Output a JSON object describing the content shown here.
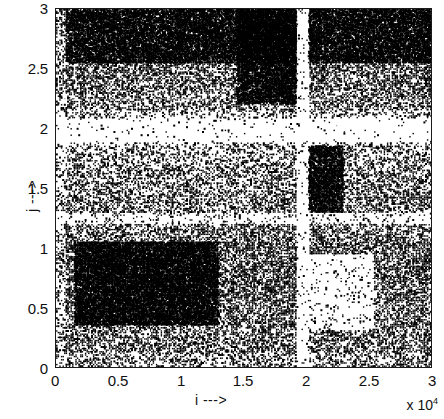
{
  "chart_data": {
    "type": "scatter",
    "title": "",
    "subtitle": "",
    "xlabel": "i --->",
    "ylabel": "j --->",
    "x_exponent_label": "x 10",
    "x_exponent_power": "4",
    "xlim": [
      0,
      3
    ],
    "ylim": [
      0,
      3
    ],
    "x_unit_scale": 10000,
    "y_unit_scale": 10000,
    "xticks": [
      "0",
      "0.5",
      "1",
      "1.5",
      "2",
      "2.5",
      "3"
    ],
    "yticks": [
      "0",
      "0.5",
      "1",
      "1.5",
      "2",
      "2.5",
      "3"
    ],
    "xtick_values": [
      0,
      0.5,
      1,
      1.5,
      2,
      2.5,
      3
    ],
    "ytick_values": [
      0,
      0.5,
      1,
      1.5,
      2,
      2.5,
      3
    ],
    "grid": false,
    "legend": null,
    "marker_color": "#000000",
    "background_color": "#ffffff",
    "axis_color": "#1a1a1a",
    "density_bands": {
      "note": "Approximate point-density as fraction of area covered, read from the image. Rows are horizontal bands in j, columns are vertical bands in i.",
      "j_bands": [
        {
          "from": 2.88,
          "to": 3.0,
          "density": 0.72
        },
        {
          "from": 2.6,
          "to": 2.88,
          "density": 0.66
        },
        {
          "from": 2.3,
          "to": 2.6,
          "density": 0.58
        },
        {
          "from": 2.15,
          "to": 2.3,
          "density": 0.4
        },
        {
          "from": 2.05,
          "to": 2.15,
          "density": 0.12
        },
        {
          "from": 1.85,
          "to": 2.05,
          "density": 0.05
        },
        {
          "from": 1.7,
          "to": 1.85,
          "density": 0.22
        },
        {
          "from": 1.45,
          "to": 1.7,
          "density": 0.34
        },
        {
          "from": 1.3,
          "to": 1.45,
          "density": 0.4
        },
        {
          "from": 1.2,
          "to": 1.3,
          "density": 0.16
        },
        {
          "from": 1.05,
          "to": 1.2,
          "density": 0.45
        },
        {
          "from": 0.55,
          "to": 1.05,
          "density": 0.6
        },
        {
          "from": 0.3,
          "to": 0.55,
          "density": 0.52
        },
        {
          "from": 0.12,
          "to": 0.3,
          "density": 0.44
        },
        {
          "from": 0.0,
          "to": 0.12,
          "density": 0.26
        }
      ],
      "i_bands": [
        {
          "from": 0.0,
          "to": 0.08,
          "density": 0.18
        },
        {
          "from": 0.08,
          "to": 0.45,
          "density": 0.55
        },
        {
          "from": 0.45,
          "to": 0.95,
          "density": 0.5
        },
        {
          "from": 0.95,
          "to": 1.4,
          "density": 0.44
        },
        {
          "from": 1.4,
          "to": 1.78,
          "density": 0.58
        },
        {
          "from": 1.78,
          "to": 1.92,
          "density": 0.7
        },
        {
          "from": 1.92,
          "to": 2.02,
          "density": 0.1
        },
        {
          "from": 2.02,
          "to": 2.25,
          "density": 0.62
        },
        {
          "from": 2.25,
          "to": 2.62,
          "density": 0.5
        },
        {
          "from": 2.62,
          "to": 3.0,
          "density": 0.56
        }
      ],
      "dense_blocks": [
        {
          "i_from": 0.15,
          "i_to": 1.3,
          "j_from": 0.35,
          "j_to": 1.05,
          "density": 0.93
        },
        {
          "i_from": 0.08,
          "i_to": 3.0,
          "j_from": 2.55,
          "j_to": 3.0,
          "density": 0.8
        },
        {
          "i_from": 1.45,
          "i_to": 1.95,
          "j_from": 2.2,
          "j_to": 3.0,
          "density": 0.86
        },
        {
          "i_from": 2.02,
          "i_to": 2.3,
          "j_from": 1.25,
          "j_to": 1.85,
          "density": 0.82
        }
      ],
      "sparse_blocks": [
        {
          "i_from": 0.0,
          "i_to": 3.0,
          "j_from": 1.88,
          "j_to": 2.08,
          "density": 0.04
        },
        {
          "i_from": 1.92,
          "i_to": 2.02,
          "j_from": 0.0,
          "j_to": 3.0,
          "density": 0.07
        },
        {
          "i_from": 1.95,
          "i_to": 2.55,
          "j_from": 0.3,
          "j_to": 0.95,
          "density": 0.09
        },
        {
          "i_from": 0.0,
          "i_to": 3.0,
          "j_from": 1.2,
          "j_to": 1.3,
          "density": 0.14
        }
      ]
    }
  },
  "figure": {
    "axis_line_width": "1.5px"
  }
}
